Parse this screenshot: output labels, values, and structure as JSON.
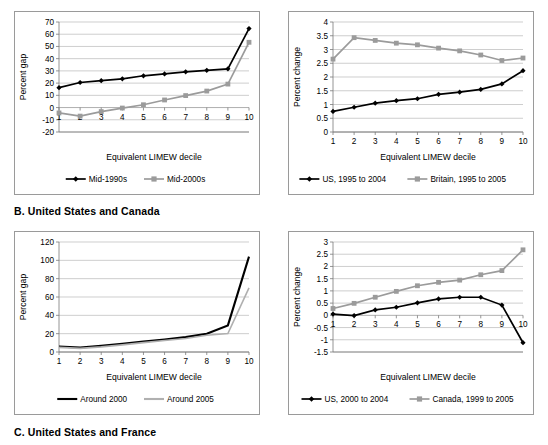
{
  "figure": {
    "sections": [
      {
        "id": "B",
        "label": "B. United States and Canada"
      },
      {
        "id": "C",
        "label": "C. United States and France"
      }
    ],
    "colors": {
      "dark_series": "#000000",
      "light_series": "#9b9b9b",
      "gridline": "#b9b9b9",
      "border": "#9a9a9a"
    }
  },
  "chart_data": [
    {
      "id": "chart-top-left",
      "type": "line",
      "title": "",
      "xlabel": "Equivalent LIMEW decile",
      "ylabel": "Percent gap",
      "x": [
        1,
        2,
        3,
        4,
        5,
        6,
        7,
        8,
        9,
        10
      ],
      "xticklabels": [
        "1",
        "2",
        "3",
        "4",
        "5",
        "6",
        "7",
        "8",
        "9",
        "10"
      ],
      "ylim": [
        -20,
        70
      ],
      "yticks": [
        -20,
        -10,
        0,
        10,
        20,
        30,
        40,
        50,
        60,
        70
      ],
      "yticklabels": [
        "-20",
        "-10",
        "0",
        "10",
        "20",
        "30",
        "40",
        "50",
        "60",
        "70"
      ],
      "grid": true,
      "legend_position": "bottom",
      "series": [
        {
          "name": "Mid-1990s",
          "marker": "diamond",
          "color": "#000000",
          "values": [
            16.3,
            20.5,
            22.0,
            23.5,
            26.0,
            27.5,
            29.2,
            30.5,
            31.7,
            64.6
          ]
        },
        {
          "name": "Mid-2000s",
          "marker": "square",
          "color": "#9b9b9b",
          "values": [
            -4.4,
            -7.0,
            -3.3,
            -0.4,
            2.3,
            6.2,
            9.8,
            13.5,
            19.2,
            53.4
          ]
        }
      ]
    },
    {
      "id": "chart-top-right",
      "type": "line",
      "title": "",
      "xlabel": "Equivalent LIMEW decile",
      "ylabel": "Percent change",
      "x": [
        1,
        2,
        3,
        4,
        5,
        6,
        7,
        8,
        9,
        10
      ],
      "xticklabels": [
        "1",
        "2",
        "3",
        "4",
        "5",
        "6",
        "7",
        "8",
        "9",
        "10"
      ],
      "ylim": [
        0,
        4
      ],
      "yticks": [
        0,
        0.5,
        1,
        1.5,
        2,
        2.5,
        3,
        3.5,
        4
      ],
      "yticklabels": [
        "0",
        "0.5",
        "1",
        "1.5",
        "2",
        "2.5",
        "3",
        "3.5",
        "4"
      ],
      "grid": true,
      "legend_position": "bottom",
      "series": [
        {
          "name": "US, 1995 to 2004",
          "marker": "diamond",
          "color": "#000000",
          "values": [
            0.75,
            0.9,
            1.05,
            1.14,
            1.21,
            1.37,
            1.45,
            1.55,
            1.75,
            2.23
          ]
        },
        {
          "name": "Britain, 1995 to 2005",
          "marker": "square",
          "color": "#9b9b9b",
          "values": [
            2.65,
            3.43,
            3.33,
            3.23,
            3.17,
            3.05,
            2.95,
            2.8,
            2.6,
            2.69
          ]
        }
      ]
    },
    {
      "id": "chart-bottom-left",
      "type": "line",
      "title": "",
      "xlabel": "Equivalent LIMEW decile",
      "ylabel": "Percent gap",
      "x": [
        1,
        2,
        3,
        4,
        5,
        6,
        7,
        8,
        9,
        10
      ],
      "xticklabels": [
        "1",
        "2",
        "3",
        "4",
        "5",
        "6",
        "7",
        "8",
        "9",
        "10"
      ],
      "ylim": [
        0,
        120
      ],
      "yticks": [
        0,
        20,
        40,
        60,
        80,
        100,
        120
      ],
      "yticklabels": [
        "0",
        "20",
        "40",
        "60",
        "80",
        "100",
        "120"
      ],
      "grid": true,
      "legend_position": "bottom",
      "series": [
        {
          "name": "Around 2000",
          "marker": "none",
          "color": "#000000",
          "values": [
            6.0,
            4.8,
            6.8,
            9.0,
            11.3,
            13.6,
            16.2,
            20.0,
            29.0,
            104.0
          ]
        },
        {
          "name": "Around 2005",
          "marker": "none",
          "color": "#b0b0b0",
          "values": [
            5.0,
            4.0,
            5.6,
            7.8,
            10.2,
            12.5,
            14.8,
            18.2,
            20.2,
            70.0
          ]
        }
      ]
    },
    {
      "id": "chart-bottom-right",
      "type": "line",
      "title": "",
      "xlabel": "Equivalent LIMEW decile",
      "ylabel": "Percent change",
      "x": [
        1,
        2,
        3,
        4,
        5,
        6,
        7,
        8,
        9,
        10
      ],
      "xticklabels": [
        "1",
        "2",
        "3",
        "4",
        "5",
        "6",
        "7",
        "8",
        "9",
        "10"
      ],
      "ylim": [
        -1.5,
        3
      ],
      "yticks": [
        -1.5,
        -1,
        -0.5,
        0,
        0.5,
        1,
        1.5,
        2,
        2.5,
        3
      ],
      "yticklabels": [
        "-1.5",
        "-1",
        "-0.5",
        "0",
        "0.5",
        "1",
        "1.5",
        "2",
        "2.5",
        "3"
      ],
      "grid": true,
      "legend_position": "bottom",
      "series": [
        {
          "name": "US, 2000 to 2004",
          "marker": "diamond",
          "color": "#000000",
          "values": [
            0.05,
            -0.01,
            0.22,
            0.33,
            0.51,
            0.67,
            0.74,
            0.74,
            0.42,
            -1.12
          ]
        },
        {
          "name": "Canada, 1999 to 2005",
          "marker": "square",
          "color": "#9b9b9b",
          "values": [
            0.28,
            0.49,
            0.74,
            0.98,
            1.21,
            1.35,
            1.44,
            1.66,
            1.83,
            2.68
          ]
        }
      ]
    }
  ]
}
